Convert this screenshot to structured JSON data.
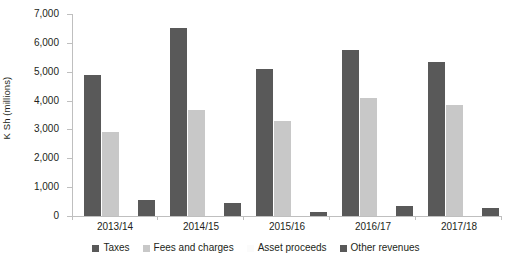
{
  "chart_data": {
    "type": "bar",
    "title": "",
    "subtitle": "",
    "xlabel": "",
    "ylabel": "K Sh (millions)",
    "categories": [
      "2013/14",
      "2014/15",
      "2015/16",
      "2016/17",
      "2017/18"
    ],
    "series": [
      {
        "name": "Taxes",
        "color": "#595959",
        "values": [
          4880,
          6500,
          5100,
          5750,
          5330
        ]
      },
      {
        "name": "Fees and charges",
        "color": "#c8c8c8",
        "values": [
          2900,
          3690,
          3300,
          4100,
          3840
        ]
      },
      {
        "name": "Asset proceeds",
        "color": "#fbfbfb",
        "values": [
          0,
          0,
          0,
          0,
          0
        ]
      },
      {
        "name": "Other revenues",
        "color": "#595959",
        "values": [
          560,
          450,
          130,
          340,
          280
        ]
      }
    ],
    "ylim": [
      0,
      7000
    ],
    "ytick_values": [
      0,
      1000,
      2000,
      3000,
      4000,
      5000,
      6000,
      7000
    ],
    "ytick_labels": [
      "0",
      "1,000",
      "2,000",
      "3,000",
      "4,000",
      "5,000",
      "6,000",
      "7,000"
    ],
    "grid": false,
    "legend_position": "bottom",
    "axis_color": "#bfbfbf",
    "text_color": "#231f20",
    "background": "#ffffff"
  }
}
